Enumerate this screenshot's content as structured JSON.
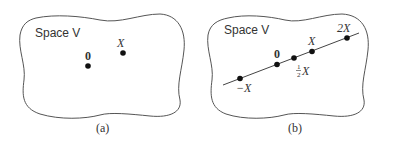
{
  "panels": [
    {
      "id": "a",
      "space_label": "Space V",
      "caption": "(a)",
      "points": [
        {
          "label": "0",
          "bold": true
        },
        {
          "label": "X",
          "italic": true
        }
      ]
    },
    {
      "id": "b",
      "space_label": "Space V",
      "caption": "(b)",
      "points": [
        {
          "label": "−X",
          "italic": true
        },
        {
          "label": "0",
          "bold": true
        },
        {
          "label_num": "1",
          "label_den": "2",
          "label_var": "X"
        },
        {
          "label": "X",
          "italic": true
        },
        {
          "label": "2X",
          "italic": true
        }
      ]
    }
  ],
  "colors": {
    "stroke": "#555555",
    "dot": "#111111",
    "text": "#333333"
  }
}
